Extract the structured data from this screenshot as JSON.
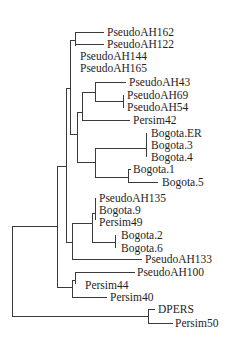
{
  "figure": {
    "type": "phylogenetic-tree",
    "orientation": "left-to-right",
    "line_color": "#3a3a3a",
    "text_color": "#1e1e1e",
    "background": "#ffffff",
    "topology": "((((((PseudoAH162,PseudoAH122),PseudoAH144,PseudoAH165),(((PseudoAH43,(PseudoAH69,PseudoAH54)),Persim42),((Bogota.ER,Bogota.3,Bogota.4),(Bogota.1,Bogota.5)))),(((PseudoAH135,Bogota.9,Persim49),(Bogota.2,Bogota.6)),PseudoAH133)),((PseudoAH100,Persim44),Persim40)),(DPERS,Persim50));"
  },
  "tree": {
    "tips": [
      {
        "label": "PseudoAH162"
      },
      {
        "label": "PseudoAH122"
      },
      {
        "label": "PseudoAH144"
      },
      {
        "label": "PseudoAH165"
      },
      {
        "label": "PseudoAH43"
      },
      {
        "label": "PseudoAH69"
      },
      {
        "label": "PseudoAH54"
      },
      {
        "label": "Persim42"
      },
      {
        "label": "Bogota.ER"
      },
      {
        "label": "Bogota.3"
      },
      {
        "label": "Bogota.4"
      },
      {
        "label": "Bogota.1"
      },
      {
        "label": "Bogota.5"
      },
      {
        "label": "PseudoAH135"
      },
      {
        "label": "Bogota.9"
      },
      {
        "label": "Persim49"
      },
      {
        "label": "Bogota.2"
      },
      {
        "label": "Bogota.6"
      },
      {
        "label": "PseudoAH133"
      },
      {
        "label": "PseudoAH100"
      },
      {
        "label": "Persim44"
      },
      {
        "label": "Persim40"
      },
      {
        "label": "DPERS"
      },
      {
        "label": "Persim50"
      }
    ]
  }
}
